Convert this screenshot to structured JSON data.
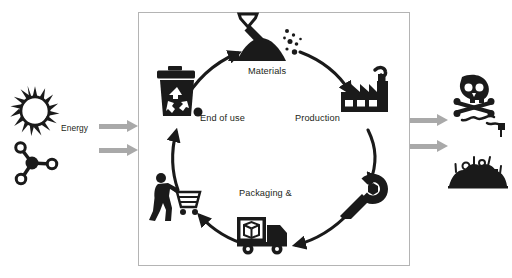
{
  "diagram": {
    "frame": {
      "border_color": "#b4b4b4"
    },
    "colors": {
      "ink": "#231f20",
      "block_arrow": "#a9a9a9",
      "frame_border": "#b4b4b4",
      "background": "#ffffff"
    },
    "labels": {
      "energy": "Energy",
      "materials": "Materials",
      "production": "Production",
      "end_of_use": "End of use",
      "packaging": "Packaging &"
    },
    "inputs": [
      {
        "name": "sun-icon",
        "semantic": "solar-energy-input"
      },
      {
        "name": "molecule-icon",
        "semantic": "material-resource-input"
      }
    ],
    "outputs": [
      {
        "name": "skull-crossbones-icon",
        "semantic": "toxic-emissions-output"
      },
      {
        "name": "landfill-icon",
        "semantic": "waste-landfill-output"
      }
    ],
    "cycle_nodes": [
      {
        "name": "mining-shovel-icon",
        "label": "Materials",
        "position": "top"
      },
      {
        "name": "factory-icon",
        "label": "Production",
        "position": "right-top"
      },
      {
        "name": "wrench-icon",
        "label": "",
        "position": "right-bottom"
      },
      {
        "name": "delivery-truck-icon",
        "label": "Packaging &",
        "position": "bottom"
      },
      {
        "name": "shopper-cart-icon",
        "label": "",
        "position": "left-bottom"
      },
      {
        "name": "recycle-bin-icon",
        "label": "End of use",
        "position": "left-top"
      }
    ],
    "block_arrows": [
      {
        "name": "energy-input-arrow",
        "direction": "right"
      },
      {
        "name": "material-input-arrow",
        "direction": "right"
      },
      {
        "name": "emissions-output-arrow",
        "direction": "right"
      },
      {
        "name": "waste-output-arrow",
        "direction": "right"
      }
    ],
    "curved_arrows": [
      {
        "name": "arrow-endofuse-to-materials"
      },
      {
        "name": "arrow-materials-to-production"
      },
      {
        "name": "arrow-production-to-wrench"
      },
      {
        "name": "arrow-wrench-to-truck"
      },
      {
        "name": "arrow-truck-to-shopper"
      },
      {
        "name": "arrow-shopper-to-endofuse"
      }
    ]
  }
}
